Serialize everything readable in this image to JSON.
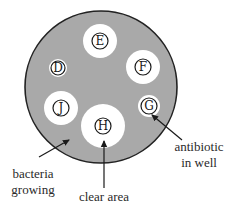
{
  "diagram": {
    "type": "agar plate antibiotic sensitivity test",
    "colors": {
      "background": "#ffffff",
      "bacteria_lawn": "#a9a9a9",
      "plate_outline": "#222222",
      "clear_area": "#ffffff",
      "ink": "#1a1a1a"
    },
    "plate": {
      "cx": 101,
      "cy": 87,
      "r": 76
    },
    "wells": [
      {
        "label": "E",
        "cx": 100,
        "cy": 41,
        "clear_r": 17,
        "well_r": 8
      },
      {
        "label": "D",
        "cx": 58,
        "cy": 68,
        "clear_r": 9,
        "well_r": 7
      },
      {
        "label": "F",
        "cx": 143,
        "cy": 67,
        "clear_r": 17,
        "well_r": 8
      },
      {
        "label": "J",
        "cx": 61,
        "cy": 108,
        "clear_r": 17,
        "well_r": 8
      },
      {
        "label": "H",
        "cx": 103,
        "cy": 126,
        "clear_r": 22,
        "well_r": 8
      },
      {
        "label": "G",
        "cx": 149,
        "cy": 106,
        "clear_r": 11,
        "well_r": 8
      }
    ],
    "annotations": {
      "antibiotic": {
        "line1": "antibiotic",
        "line2": "in well"
      },
      "bacteria": {
        "line1": "bacteria",
        "line2": "growing"
      },
      "clear": {
        "line1": "clear area"
      }
    }
  }
}
